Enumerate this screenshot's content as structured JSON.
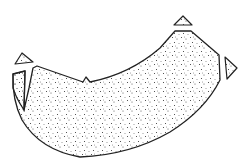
{
  "illustration": {
    "subject": "stippled curved fragment with detached triangular chips",
    "colors": {
      "background": "#ffffff",
      "outline": "#222222",
      "stipple": "#333333"
    },
    "parts": [
      {
        "name": "main-body",
        "points": "33,68 37,66 83,82 86,77 90,82 120,76 150,60 175,31 191,31 219,55 220,80 205,105 185,122 160,138 130,152 100,157 75,157 50,148 30,135 18,112 13,95 13,74 24,70 22,104 33,68"
      },
      {
        "name": "left-sliver",
        "points": "13,74 25,70 24,110 16,100 13,90"
      },
      {
        "name": "top-left-chip",
        "points": "15,64 22,53 33,62"
      },
      {
        "name": "top-right-chip",
        "points": "174,25 183,16 192,25"
      },
      {
        "name": "right-chip",
        "points": "225,57 237,68 227,79"
      }
    ]
  }
}
